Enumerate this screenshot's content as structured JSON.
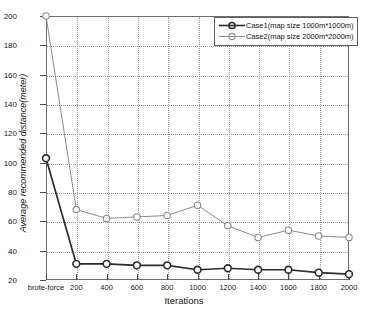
{
  "chart_data": {
    "type": "line",
    "title": "",
    "xlabel": "Iterations",
    "ylabel": "Average recommended distance(meter)",
    "x_categories": [
      "brute-force",
      "200",
      "400",
      "600",
      "800",
      "1000",
      "1200",
      "1400",
      "1600",
      "1800",
      "2000"
    ],
    "y_ticks": [
      "20",
      "40",
      "60",
      "80",
      "100",
      "120",
      "140",
      "160",
      "180",
      "200"
    ],
    "ylim": [
      20,
      200
    ],
    "grid": true,
    "legend_position": "top-right",
    "series": [
      {
        "name": "Case1(map size 1000m*1000m)",
        "color": "#2b2b2b",
        "marker": "circle",
        "values": [
          103,
          31,
          31,
          30,
          30,
          27,
          28,
          27,
          27,
          25,
          24
        ]
      },
      {
        "name": "Case2(map size 2000m*2000m)",
        "color": "#8c8c8c",
        "marker": "circle",
        "values": [
          200,
          68,
          62,
          63,
          64,
          71,
          57,
          49,
          54,
          50,
          49
        ]
      }
    ]
  },
  "legend": {
    "entries": [
      {
        "label": "Case1(map size 1000m*1000m)"
      },
      {
        "label": "Case2(map size 2000m*2000m)"
      }
    ]
  }
}
